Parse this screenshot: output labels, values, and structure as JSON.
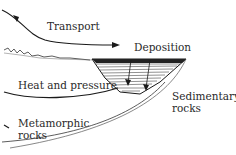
{
  "diagram": {
    "type": "rock-cycle",
    "labels": {
      "transport": "Transport",
      "deposition": "Deposition",
      "heat_pressure": "Heat and pressure",
      "sedimentary_line1": "Sedimentary",
      "sedimentary_line2": "rocks",
      "metamorphic_line1": "Metamorphic",
      "metamorphic_line2": "rocks"
    },
    "colors": {
      "ink": "#1a1a1a",
      "background": "#ffffff"
    }
  }
}
